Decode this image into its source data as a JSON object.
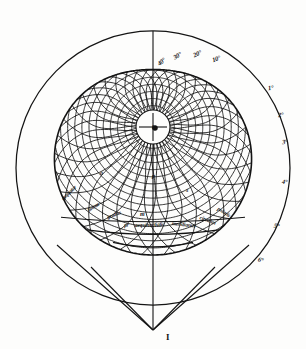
{
  "figure": {
    "medium": "engraving",
    "background_color": "#fdfdfc",
    "ink_color": "#141414"
  },
  "geometry": {
    "outer_circle": {
      "cx": 153,
      "cy": 168,
      "r": 137
    },
    "pole_center": {
      "cx": 153,
      "cy": 127
    },
    "inner_circles": [
      9,
      17
    ],
    "parallel_count": 18,
    "meridian_count": 36,
    "cusp": {
      "x": 153,
      "y": 78
    },
    "apex": {
      "x": 153,
      "y": 330
    }
  },
  "degree_labels": {
    "top_arc": [
      {
        "text": "10°",
        "x": 212,
        "y": 55,
        "rot": -18
      },
      {
        "text": "20°",
        "x": 193,
        "y": 50,
        "rot": -24
      },
      {
        "text": "30°",
        "x": 173,
        "y": 52,
        "rot": -30
      },
      {
        "text": "40°",
        "x": 157,
        "y": 58,
        "rot": -38
      }
    ],
    "right_rim": [
      {
        "text": "1°",
        "x": 268,
        "y": 84,
        "rot": -8
      },
      {
        "text": "2°",
        "x": 278,
        "y": 111,
        "rot": -5
      },
      {
        "text": "3°",
        "x": 282,
        "y": 138,
        "rot": -3
      },
      {
        "text": "4°",
        "x": 282,
        "y": 178,
        "rot": 4
      },
      {
        "text": "5°",
        "x": 274,
        "y": 222,
        "rot": 10
      },
      {
        "text": "6°",
        "x": 258,
        "y": 256,
        "rot": 16
      }
    ]
  },
  "cell_labels": [
    {
      "text": "h",
      "x": 152,
      "y": 124
    },
    {
      "text": "p",
      "x": 152,
      "y": 173
    },
    {
      "text": "s",
      "x": 186,
      "y": 187
    },
    {
      "text": "m",
      "x": 140,
      "y": 211
    },
    {
      "text": "o",
      "x": 100,
      "y": 170
    }
  ],
  "script_bands": {
    "left_arc": [
      {
        "text": "aequator",
        "x": 62,
        "y": 196,
        "rot": -44
      },
      {
        "text": "lineae",
        "x": 88,
        "y": 207,
        "rot": -32
      },
      {
        "text": "gradus",
        "x": 107,
        "y": 214,
        "rot": -20
      }
    ],
    "center_arc": [
      {
        "text": "pr",
        "x": 124,
        "y": 222,
        "rot": -6
      },
      {
        "text": "aequinoctialis",
        "x": 135,
        "y": 222,
        "rot": -2
      },
      {
        "text": "meridianus",
        "x": 172,
        "y": 220,
        "rot": 6
      }
    ],
    "right_arc": [
      {
        "text": "circulus",
        "x": 200,
        "y": 214,
        "rot": 20
      },
      {
        "text": "polaris",
        "x": 218,
        "y": 205,
        "rot": 32
      }
    ]
  },
  "point_labels": [
    {
      "text": "I",
      "x": 166,
      "y": 332
    }
  ]
}
